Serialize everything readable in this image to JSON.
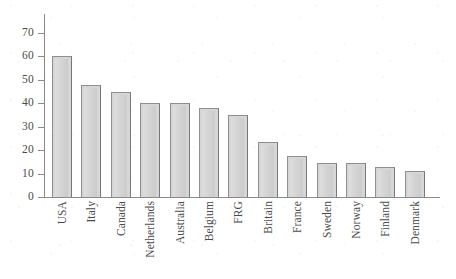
{
  "chart_data": {
    "type": "bar",
    "title": "",
    "subtitle": "",
    "xlabel": "",
    "ylabel": "",
    "ylim": [
      0,
      70
    ],
    "ytick_values": [
      0,
      10,
      20,
      30,
      40,
      50,
      60,
      70
    ],
    "ytick_labels": [
      "0",
      "10",
      "20",
      "30",
      "40",
      "50",
      "60",
      "70"
    ],
    "grid": false,
    "legend": false,
    "legend_position": "none",
    "axis_top_open": true,
    "orientation": "vertical",
    "bar_fill_color": "#d6d6d6",
    "bar_edge_color": "#8f8f8f",
    "axis_color": "#8a8a8a",
    "text_color": "#4a4a4a",
    "background_color": "#ffffff",
    "xtick_label_rotation": 90,
    "categories": [
      "USA",
      "Italy",
      "Canada",
      "Netherlands",
      "Australia",
      "Belgium",
      "FRG",
      "Britain",
      "France",
      "Sweden",
      "Norway",
      "Finland",
      "Denmark"
    ],
    "values": [
      60,
      48,
      45,
      40,
      40,
      38,
      35,
      23.5,
      17.5,
      14.5,
      14.5,
      13,
      11
    ]
  }
}
